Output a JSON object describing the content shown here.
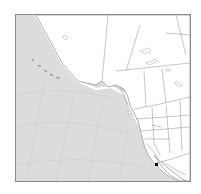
{
  "map": {
    "region": "North Pacific and Western North America",
    "colors": {
      "ocean": "#dcdcdc",
      "land": "#ffffff",
      "borders": "#8c8c8c",
      "frame": "#8a8a8a",
      "marker": "#000000"
    },
    "marker": {
      "icon": "location-dot-icon",
      "approx_location": "off Baja California / Southern California coast"
    },
    "features": [
      "coastline",
      "country-borders",
      "state-province-borders",
      "graticule",
      "lakes"
    ]
  }
}
